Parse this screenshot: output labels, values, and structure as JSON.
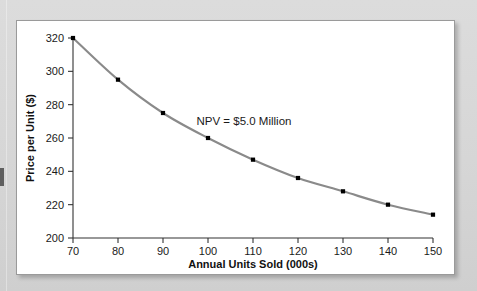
{
  "figure": {
    "panel_background": "#ffffff",
    "page_background": "#d9d9d9",
    "border_color": "#9a9a9a"
  },
  "chart_data": {
    "type": "line",
    "title": "",
    "subtitle": "",
    "xlabel": "Annual Units Sold (000s)",
    "ylabel": "Price per Unit ($)",
    "x": [
      70,
      80,
      90,
      100,
      110,
      120,
      130,
      140,
      150
    ],
    "values": [
      320,
      295,
      275,
      260,
      247,
      236,
      228,
      220,
      214
    ],
    "series": [
      {
        "name": "Price per Unit",
        "values": [
          320,
          295,
          275,
          260,
          247,
          236,
          228,
          220,
          214
        ],
        "line_color": "#8a8a8a",
        "marker_color": "#000000",
        "marker": "square"
      }
    ],
    "xlim": [
      70,
      150
    ],
    "ylim": [
      200,
      320
    ],
    "xticks": [
      70,
      80,
      90,
      100,
      110,
      120,
      130,
      140,
      150
    ],
    "yticks": [
      200,
      220,
      240,
      260,
      280,
      300,
      320
    ],
    "xtick_labels": [
      "70",
      "80",
      "90",
      "100",
      "110",
      "120",
      "130",
      "140",
      "150"
    ],
    "ytick_labels": [
      "200",
      "220",
      "240",
      "260",
      "280",
      "300",
      "320"
    ],
    "grid": false,
    "legend": false,
    "legend_position": "none",
    "annotations": [
      {
        "text": "NPV = $5.0 Million",
        "x": 108,
        "y": 268
      }
    ]
  }
}
